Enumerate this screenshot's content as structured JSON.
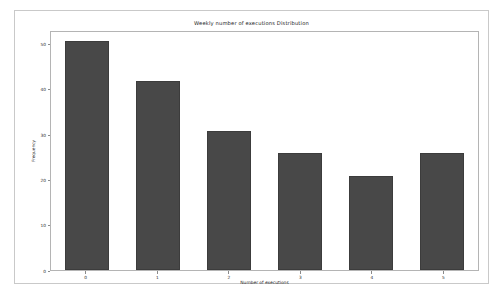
{
  "chart_data": {
    "type": "bar",
    "title": "Weekly number of executions Distribution",
    "xlabel": "Number of executions",
    "ylabel": "Frequency",
    "categories": [
      "0",
      "1",
      "2",
      "3",
      "4",
      "5"
    ],
    "values": [
      51,
      42,
      31,
      26,
      21,
      26
    ],
    "xlim": [
      -0.5,
      5.5
    ],
    "ylim": [
      0,
      53
    ],
    "yticks": [
      0,
      10,
      20,
      30,
      40,
      50
    ],
    "ytick_labels": [
      "0",
      "10",
      "20",
      "30",
      "40",
      "50"
    ],
    "xticks": [
      0,
      1,
      2,
      3,
      4,
      5
    ],
    "xtick_labels": [
      "0",
      "1",
      "2",
      "3",
      "4",
      "5"
    ],
    "grid": false,
    "legend": null,
    "bar_color": "#484848",
    "bar_edge_color": "#3c3c3c",
    "bar_width": 0.62,
    "background_color": "#ffffff",
    "axes_edge_color": "#b4b4b4",
    "figure_border_color": "#c9c9c9"
  }
}
